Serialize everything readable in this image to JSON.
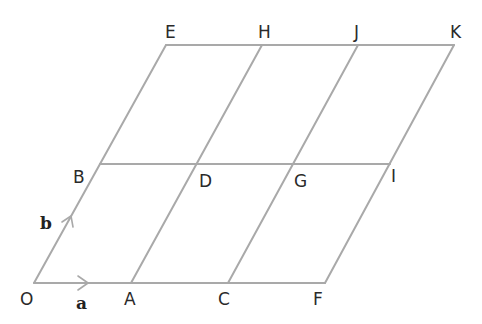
{
  "diagram": {
    "type": "parallelogram-grid",
    "colors": {
      "line": "#a9a9a9",
      "text": "#2a2a2a"
    },
    "points": {
      "O": {
        "label": "O",
        "x": 34,
        "y": 283
      },
      "A": {
        "label": "A",
        "x": 131,
        "y": 283
      },
      "C": {
        "label": "C",
        "x": 228,
        "y": 283
      },
      "F": {
        "label": "F",
        "x": 325,
        "y": 283
      },
      "B": {
        "label": "B",
        "x": 100,
        "y": 164
      },
      "D": {
        "label": "D",
        "x": 197,
        "y": 164
      },
      "G": {
        "label": "G",
        "x": 294,
        "y": 164
      },
      "I": {
        "label": "I",
        "x": 390,
        "y": 164
      },
      "E": {
        "label": "E",
        "x": 166,
        "y": 45
      },
      "H": {
        "label": "H",
        "x": 262,
        "y": 45
      },
      "J": {
        "label": "J",
        "x": 358,
        "y": 45
      },
      "K": {
        "label": "K",
        "x": 454,
        "y": 45
      }
    },
    "vectors": {
      "a": {
        "label": "a",
        "from": "O",
        "to": "A"
      },
      "b": {
        "label": "b",
        "from": "O",
        "to": "B"
      }
    }
  }
}
